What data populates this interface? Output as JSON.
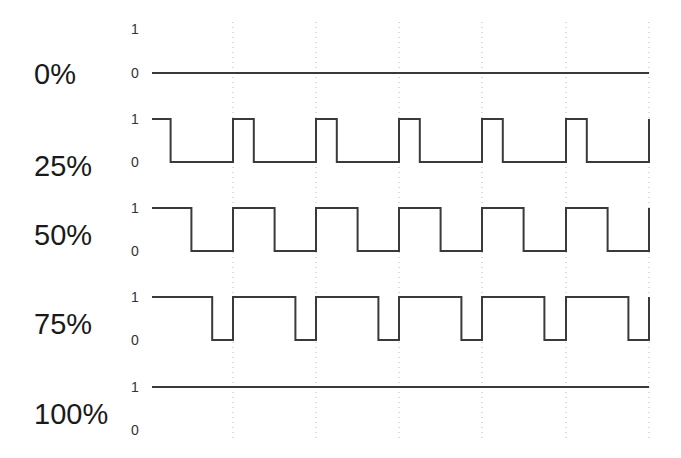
{
  "diagram": {
    "period_px": 83.2,
    "x_start": 152,
    "x_end": 649,
    "gridlines_x": [
      233,
      316,
      399,
      482,
      566,
      649
    ],
    "grid_top": 22,
    "grid_bottom": 438,
    "colors": {
      "wave": "#3a3a3a",
      "grid": "#b8b8b8",
      "text": "#1a1a1a"
    },
    "rows": [
      {
        "label": "0%",
        "duty": 0.0,
        "high_y": 29,
        "low_y": 73,
        "label_y": 84,
        "one_label": "1",
        "zero_label": "0"
      },
      {
        "label": "25%",
        "duty": 0.25,
        "high_y": 119,
        "low_y": 162,
        "label_y": 176,
        "one_label": "1",
        "zero_label": "0"
      },
      {
        "label": "50%",
        "duty": 0.5,
        "high_y": 208,
        "low_y": 251,
        "label_y": 245,
        "one_label": "1",
        "zero_label": "0"
      },
      {
        "label": "75%",
        "duty": 0.75,
        "high_y": 297,
        "low_y": 340,
        "label_y": 334,
        "one_label": "1",
        "zero_label": "0"
      },
      {
        "label": "100%",
        "duty": 1.0,
        "high_y": 387,
        "low_y": 430,
        "label_y": 424,
        "one_label": "1",
        "zero_label": "0"
      }
    ]
  }
}
